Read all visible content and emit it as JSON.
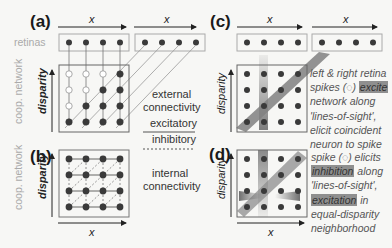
{
  "panels": {
    "a": {
      "label": "(a)"
    },
    "b": {
      "label": "(b)"
    },
    "c": {
      "label": "(c)"
    },
    "d": {
      "label": "(d)"
    }
  },
  "axes": {
    "x": "x",
    "disparity": "disparity"
  },
  "side_labels": {
    "retinas": "retinas",
    "coop_network_top": "coop. network",
    "coop_network_bottom": "coop. network"
  },
  "middle_labels": {
    "external_line1": "external",
    "external_line2": "connectivity",
    "excitatory": "excitatory",
    "inhibitory": "inhibitory",
    "internal_line1": "internal",
    "internal_line2": "connectivity"
  },
  "panel_c_text": {
    "line1": "left & right retina",
    "line2_pre": "spikes (",
    "spike_symbol": "◌",
    "line2_mid": ") ",
    "line2_hl": "excite",
    "line3": "network along",
    "line4": "'lines-of-sight',",
    "line5": "elicit coincident",
    "line6": "neuron to spike"
  },
  "panel_d_text": {
    "line1_pre": "spike (",
    "spike_symbol": "◌",
    "line1_post": ") elicits",
    "line2_hl": "inhibition",
    "line2_post": " along",
    "line3": "'lines-of-sight',",
    "line4_hl": "excitation",
    "line4_post": " in",
    "line5": "equal-disparity",
    "line6": "neighborhood"
  },
  "colors": {
    "node": "#3a3a3a",
    "box": "#888888",
    "retina_box": "#999999",
    "band": "#7a7a7a",
    "background": "#f7f7f5"
  },
  "network": {
    "rows": 4,
    "cols": 4,
    "panel_a_filled_rule": "col >= rows-1-row (lower-right triangle filled, upper-left open)"
  }
}
